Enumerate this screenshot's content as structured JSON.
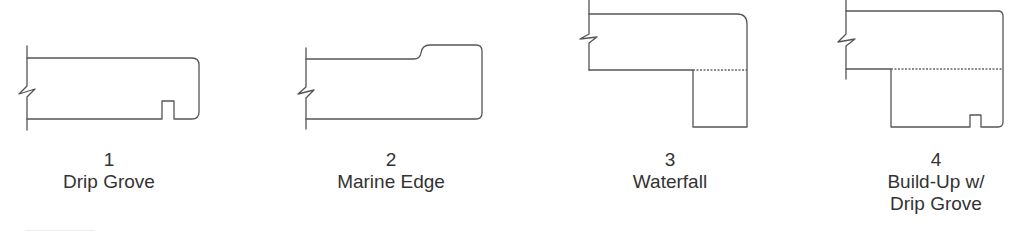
{
  "profiles": [
    {
      "number": "1",
      "name": "Drip Grove",
      "name_line2": "",
      "features": [
        "break-line",
        "rounded-edge",
        "drip-groove"
      ]
    },
    {
      "number": "2",
      "name": "Marine Edge",
      "name_line2": "",
      "features": [
        "break-line",
        "raised-marine-lip",
        "rounded-edge"
      ]
    },
    {
      "number": "3",
      "name": "Waterfall",
      "name_line2": "",
      "features": [
        "break-line",
        "rounded-edge",
        "waterfall-drop",
        "seam-line"
      ]
    },
    {
      "number": "4",
      "name": "Build-Up w/",
      "name_line2": "Drip Grove",
      "features": [
        "break-line",
        "build-up",
        "seam-line",
        "drip-groove"
      ]
    }
  ],
  "colors": {
    "stroke": "#555555",
    "text": "#333333",
    "background": "#ffffff"
  }
}
